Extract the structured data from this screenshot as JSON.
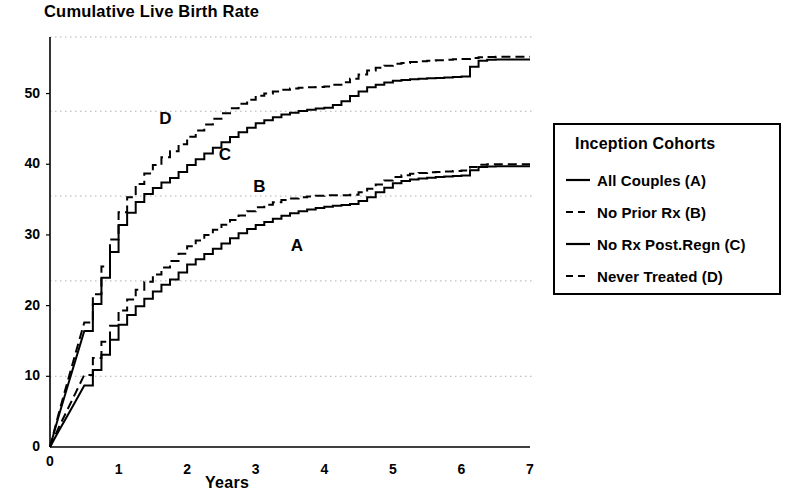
{
  "title": "Cumulative Live Birth Rate",
  "axis": {
    "x_label": "Years",
    "x_ticks": [
      "0",
      "1",
      "2",
      "3",
      "4",
      "5",
      "6",
      "7"
    ],
    "y_ticks": [
      "0",
      "10",
      "20",
      "30",
      "40",
      "50"
    ]
  },
  "curve_labels": {
    "a": "A",
    "b": "B",
    "c": "C",
    "d": "D"
  },
  "legend": {
    "title": "Inception Cohorts",
    "items": [
      {
        "label": "All Couples (A)",
        "style": "solid"
      },
      {
        "label": "No Prior Rx (B)",
        "style": "dashed"
      },
      {
        "label": "No Rx Post.Regn (C)",
        "style": "solid"
      },
      {
        "label": "Never Treated (D)",
        "style": "dashed"
      }
    ]
  },
  "colors": {
    "ink": "#000000",
    "grid": "#b0b0b0",
    "background": "#ffffff"
  },
  "chart_data": {
    "type": "line",
    "title": "Cumulative Live Birth Rate",
    "subtitle": "",
    "xlabel": "Years",
    "ylabel": "",
    "xlim": [
      0,
      7
    ],
    "ylim": [
      0,
      58
    ],
    "xticks": [
      0,
      1,
      2,
      3,
      4,
      5,
      6,
      7
    ],
    "yticks": [
      0,
      10,
      20,
      30,
      40,
      50
    ],
    "grid": "horizontal-dotted",
    "gridlines_y": [
      10,
      23.5,
      35.5,
      47.5,
      58
    ],
    "legend_position": "right",
    "step_plot": true,
    "annotations": [
      {
        "text": "A",
        "x": 3.6,
        "y": 28.3
      },
      {
        "text": "B",
        "x": 3.05,
        "y": 36.6
      },
      {
        "text": "C",
        "x": 2.55,
        "y": 41.2
      },
      {
        "text": "D",
        "x": 1.68,
        "y": 46.2
      }
    ],
    "series": [
      {
        "name": "All Couples (A)",
        "key": "a",
        "style": "solid",
        "x": [
          0,
          0.1,
          0.3,
          0.5,
          0.7,
          0.9,
          1.0,
          1.2,
          1.4,
          1.6,
          1.8,
          2.0,
          2.2,
          2.4,
          2.6,
          2.8,
          3.0,
          3.2,
          3.4,
          3.6,
          3.8,
          4.0,
          4.2,
          4.4,
          4.6,
          4.8,
          5.0,
          5.2,
          5.4,
          5.6,
          5.8,
          6.0,
          6.2,
          6.4,
          6.6,
          6.8,
          7.0
        ],
        "y": [
          0,
          1.8,
          5.2,
          8.7,
          12.2,
          15.6,
          17.3,
          19.5,
          21.2,
          22.8,
          24.0,
          25.8,
          27.0,
          28.2,
          29.4,
          30.5,
          31.4,
          32.1,
          32.8,
          33.3,
          33.7,
          34.0,
          34.2,
          34.4,
          35.2,
          36.3,
          37.3,
          37.8,
          38.0,
          38.2,
          38.3,
          38.4,
          39.6,
          39.7,
          39.7,
          39.7,
          39.7
        ]
      },
      {
        "name": "No Prior Rx (B)",
        "key": "b",
        "style": "dashed",
        "x": [
          0,
          0.1,
          0.3,
          0.5,
          0.7,
          0.9,
          1.0,
          1.2,
          1.4,
          1.6,
          1.8,
          2.0,
          2.2,
          2.4,
          2.6,
          2.8,
          3.0,
          3.2,
          3.4,
          3.6,
          3.8,
          4.0,
          4.2,
          4.4,
          4.6,
          4.8,
          5.0,
          5.2,
          5.4,
          5.6,
          5.8,
          6.0,
          6.2,
          6.4,
          6.6,
          6.8,
          7.0
        ],
        "y": [
          0,
          2.2,
          6.2,
          10.2,
          14.0,
          17.6,
          19.3,
          21.8,
          23.6,
          25.2,
          26.7,
          28.4,
          29.7,
          30.9,
          32.0,
          33.0,
          33.9,
          34.5,
          35.0,
          35.3,
          35.5,
          35.6,
          35.6,
          35.7,
          36.4,
          37.4,
          38.2,
          38.6,
          38.8,
          38.9,
          39.0,
          39.1,
          39.9,
          40.0,
          40.0,
          40.0,
          40.0
        ]
      },
      {
        "name": "No Rx Post.Regn (C)",
        "key": "c",
        "style": "solid",
        "x": [
          0,
          0.1,
          0.3,
          0.5,
          0.7,
          0.9,
          1.0,
          1.2,
          1.4,
          1.6,
          1.8,
          2.0,
          2.2,
          2.4,
          2.6,
          2.8,
          3.0,
          3.2,
          3.4,
          3.6,
          3.8,
          4.0,
          4.2,
          4.4,
          4.6,
          4.8,
          5.0,
          5.2,
          5.4,
          5.6,
          5.8,
          6.0,
          6.2,
          6.4,
          6.6,
          6.8,
          7.0
        ],
        "y": [
          0,
          3.5,
          10.0,
          16.4,
          22.5,
          28.3,
          31.4,
          34.2,
          36.0,
          37.3,
          38.3,
          39.9,
          41.2,
          42.5,
          43.7,
          44.8,
          45.8,
          46.5,
          47.1,
          47.5,
          47.8,
          48.0,
          48.6,
          49.8,
          50.8,
          51.4,
          51.8,
          52.0,
          52.1,
          52.2,
          52.3,
          52.4,
          54.6,
          54.8,
          54.8,
          54.8,
          54.8
        ]
      },
      {
        "name": "Never Treated (D)",
        "key": "d",
        "style": "dashed",
        "x": [
          0,
          0.1,
          0.3,
          0.5,
          0.7,
          0.9,
          1.0,
          1.2,
          1.4,
          1.6,
          1.8,
          2.0,
          2.2,
          2.4,
          2.6,
          2.8,
          3.0,
          3.2,
          3.4,
          3.6,
          3.8,
          4.0,
          4.2,
          4.4,
          4.6,
          4.8,
          5.0,
          5.2,
          5.4,
          5.6,
          5.8,
          6.0,
          6.2,
          6.4,
          6.6,
          6.8,
          7.0
        ],
        "y": [
          0,
          3.8,
          10.8,
          17.6,
          24.0,
          30.1,
          33.2,
          36.6,
          39.0,
          40.8,
          42.2,
          43.9,
          45.3,
          46.6,
          47.8,
          48.8,
          49.7,
          50.2,
          50.6,
          50.8,
          50.9,
          51.0,
          51.4,
          52.2,
          53.2,
          53.8,
          54.2,
          54.4,
          54.6,
          54.7,
          54.8,
          54.9,
          55.1,
          55.2,
          55.2,
          55.2,
          55.2
        ]
      }
    ]
  }
}
